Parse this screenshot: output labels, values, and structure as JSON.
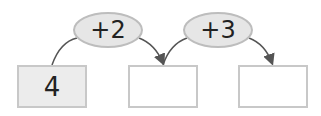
{
  "diagram": {
    "type": "number-chain",
    "boxes": [
      {
        "value": "4"
      },
      {
        "value": ""
      },
      {
        "value": ""
      }
    ],
    "operations": [
      {
        "label": "+2"
      },
      {
        "label": "+3"
      }
    ],
    "colors": {
      "box_border": "#c8c8c8",
      "filled_box_bg": "#ececec",
      "oval_bg": "#e6e6e6",
      "arrow": "#555555"
    }
  }
}
